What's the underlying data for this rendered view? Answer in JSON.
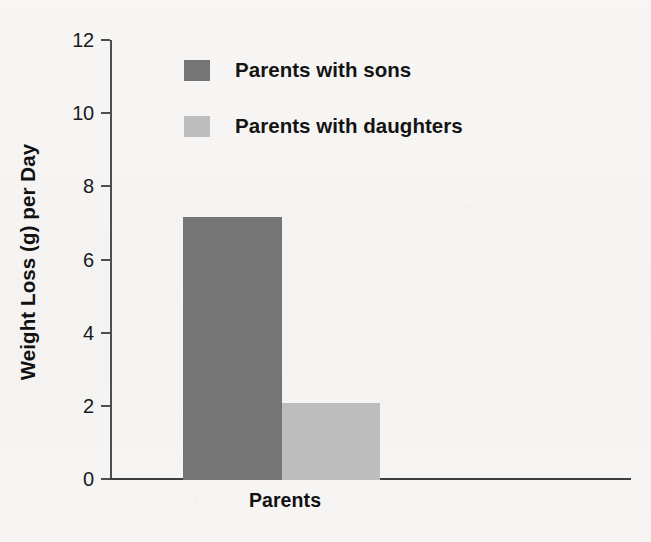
{
  "chart_data": {
    "type": "bar",
    "title": "",
    "subtitle": "",
    "xlabel": "Parents",
    "ylabel": "Weight Loss (g) per Day",
    "categories": [
      "Parents"
    ],
    "series": [
      {
        "name": "Parents with sons",
        "values": [
          7.2
        ],
        "color": "#757575"
      },
      {
        "name": "Parents with daughters",
        "values": [
          2.1
        ],
        "color": "#bdbdbd"
      }
    ],
    "ylim": [
      0,
      12
    ],
    "ytick_values": [
      0,
      2,
      4,
      6,
      8,
      10,
      12
    ],
    "ytick_labels": [
      "0",
      "2",
      "4",
      "6",
      "8",
      "10",
      "12"
    ],
    "grid": false,
    "legend_position": "upper-center",
    "annotations": []
  },
  "legend": {
    "entries": [
      {
        "label": "Parents with sons",
        "color": "#757575",
        "swatch": "legend-swatch-sons"
      },
      {
        "label": "Parents with daughters",
        "color": "#bdbdbd",
        "swatch": "legend-swatch-daughters"
      }
    ]
  },
  "axes": {
    "y_title": "Weight Loss (g) per Day",
    "x_title": "Parents",
    "ticks": [
      {
        "label": "12",
        "value": 12
      },
      {
        "label": "10",
        "value": 10
      },
      {
        "label": "8",
        "value": 8
      },
      {
        "label": "6",
        "value": 6
      },
      {
        "label": "4",
        "value": 4
      },
      {
        "label": "2",
        "value": 2
      },
      {
        "label": "0",
        "value": 0
      }
    ]
  },
  "colors": {
    "background": "#f6f5f3",
    "axis": "#4e4e4e",
    "text": "#111111",
    "bar_dark": "#757575",
    "bar_light": "#bdbdbd"
  }
}
